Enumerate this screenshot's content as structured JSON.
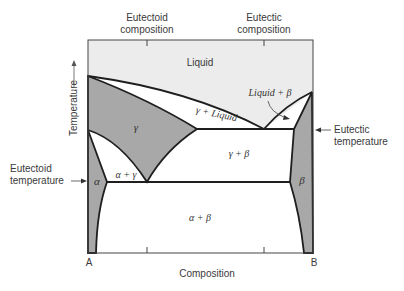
{
  "diagram": {
    "type": "binary eutectic phase diagram with eutectoid",
    "axes": {
      "x_label": "Composition",
      "y_label": "Temperature",
      "left_end": "A",
      "right_end": "B"
    },
    "top_labels": {
      "eutectoid": [
        "Eutectoid",
        "composition"
      ],
      "eutectic": [
        "Eutectic",
        "composition"
      ]
    },
    "side_labels": {
      "eutectoid_temperature": [
        "Eutectoid",
        "temperature"
      ],
      "eutectic_temperature": [
        "Eutectic",
        "temperature"
      ]
    },
    "regions": {
      "liquid": "Liquid",
      "gamma_liquid": "γ + Liquid",
      "liquid_beta": "Liquid + β",
      "gamma": "γ",
      "gamma_beta": "γ + β",
      "alpha": "α",
      "alpha_gamma": "α + γ",
      "beta": "β",
      "alpha_beta": "α + β"
    },
    "colors": {
      "liquid_fill": "#ececec",
      "solid_phase_fill": "#a8a8a8",
      "two_phase_fill": "#ffffff",
      "line": "#1e1e1e"
    }
  }
}
